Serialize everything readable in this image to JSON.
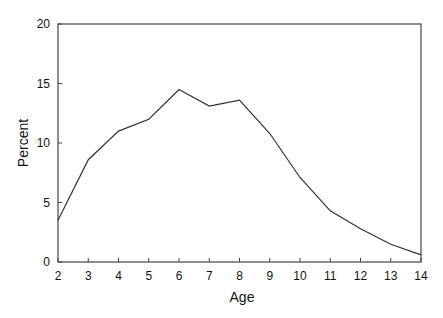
{
  "chart_data": {
    "type": "line",
    "title": "",
    "xlabel": "Age",
    "ylabel": "Percent",
    "x": [
      2,
      3,
      4,
      5,
      6,
      7,
      8,
      9,
      10,
      11,
      12,
      13,
      14
    ],
    "series": [
      {
        "name": "Percent",
        "values": [
          3.5,
          8.6,
          11.0,
          12.0,
          14.5,
          13.1,
          13.6,
          10.8,
          7.1,
          4.3,
          2.8,
          1.5,
          0.6
        ]
      }
    ],
    "xlim": [
      2,
      14
    ],
    "ylim": [
      0,
      20
    ],
    "xticks": [
      2,
      3,
      4,
      5,
      6,
      7,
      8,
      9,
      10,
      11,
      12,
      13,
      14
    ],
    "yticks": [
      0,
      5,
      10,
      15,
      20
    ],
    "grid": false,
    "legend": null
  },
  "style": {
    "line_color": "#333333",
    "axis_color": "#444444"
  }
}
